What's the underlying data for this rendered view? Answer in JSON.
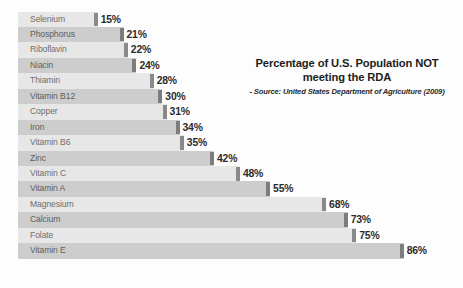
{
  "chart_data": {
    "type": "bar",
    "orientation": "horizontal",
    "title": "Percentage of U.S. Population NOT meeting the RDA",
    "title_lines": [
      "Percentage of U.S. Population NOT",
      "meeting the RDA"
    ],
    "source": "- Source: United States Department of Agriculture (2009)",
    "xlabel": "",
    "ylabel": "",
    "xlim": [
      0,
      100
    ],
    "grid": false,
    "legend": false,
    "value_suffix": "%",
    "categories": [
      "Selenium",
      "Phosphorus",
      "Riboflavin",
      "Niacin",
      "Thiamin",
      "Vitamin B12",
      "Copper",
      "Iron",
      "Vitamin B6",
      "Zinc",
      "Vitamin C",
      "Vitamin A",
      "Magnesium",
      "Calcium",
      "Folate",
      "Vitamin E"
    ],
    "values": [
      15,
      21,
      22,
      24,
      28,
      30,
      31,
      34,
      35,
      42,
      48,
      55,
      68,
      73,
      75,
      86
    ],
    "value_labels": [
      "15%",
      "21%",
      "22%",
      "24%",
      "28%",
      "30%",
      "31%",
      "34%",
      "35%",
      "42%",
      "48%",
      "55%",
      "68%",
      "73%",
      "75%",
      "86%"
    ],
    "colors": {
      "bar_light": "#e7e7e7",
      "bar_dark": "#cdcdcd",
      "bar_cap": "#8a8a8a",
      "label": "#6e6e6e",
      "value": "#2b2b2b",
      "background": "#fdfdfd"
    }
  }
}
